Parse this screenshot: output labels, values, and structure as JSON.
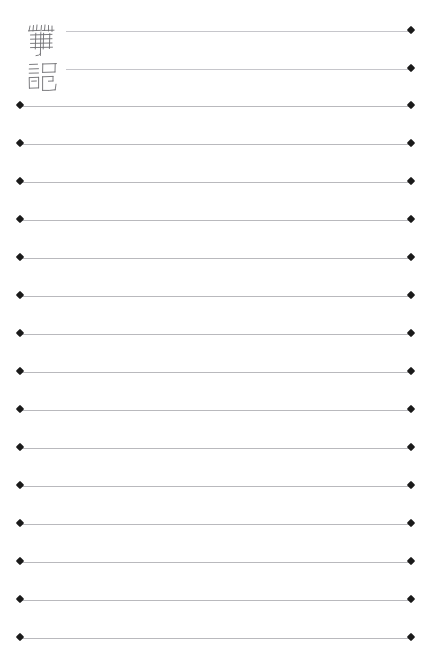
{
  "page": {
    "kind": "notebook-ruled-page",
    "width": 430,
    "height": 670,
    "background_color": "#ffffff",
    "title_text": "筆記",
    "title_reading": "bi ji",
    "title_meaning": "notes",
    "title_style": "handwritten",
    "title_ink_color": "#6e6e72"
  },
  "ruling": {
    "line_color": "#b9b9bd",
    "endpoint_color": "#1a1a1a",
    "endpoint_shape": "diamond",
    "line_count": 17,
    "left_margin_x": 20,
    "right_margin_x": 411,
    "indented_left_x": 66,
    "lines": [
      {
        "index": 1,
        "y": 31,
        "left_x": 66,
        "right_x": 411,
        "indented": true,
        "left_cap": false,
        "right_cap": true
      },
      {
        "index": 2,
        "y": 69,
        "left_x": 66,
        "right_x": 411,
        "indented": true,
        "left_cap": false,
        "right_cap": true
      },
      {
        "index": 3,
        "y": 106,
        "left_x": 20,
        "right_x": 411,
        "indented": false,
        "left_cap": true,
        "right_cap": true
      },
      {
        "index": 4,
        "y": 144,
        "left_x": 20,
        "right_x": 411,
        "indented": false,
        "left_cap": true,
        "right_cap": true
      },
      {
        "index": 5,
        "y": 182,
        "left_x": 20,
        "right_x": 411,
        "indented": false,
        "left_cap": true,
        "right_cap": true
      },
      {
        "index": 6,
        "y": 220,
        "left_x": 20,
        "right_x": 411,
        "indented": false,
        "left_cap": true,
        "right_cap": true
      },
      {
        "index": 7,
        "y": 258,
        "left_x": 20,
        "right_x": 411,
        "indented": false,
        "left_cap": true,
        "right_cap": true
      },
      {
        "index": 8,
        "y": 296,
        "left_x": 20,
        "right_x": 411,
        "indented": false,
        "left_cap": true,
        "right_cap": true
      },
      {
        "index": 9,
        "y": 334,
        "left_x": 20,
        "right_x": 411,
        "indented": false,
        "left_cap": true,
        "right_cap": true
      },
      {
        "index": 10,
        "y": 372,
        "left_x": 20,
        "right_x": 411,
        "indented": false,
        "left_cap": true,
        "right_cap": true
      },
      {
        "index": 11,
        "y": 410,
        "left_x": 20,
        "right_x": 411,
        "indented": false,
        "left_cap": true,
        "right_cap": true
      },
      {
        "index": 12,
        "y": 448,
        "left_x": 20,
        "right_x": 411,
        "indented": false,
        "left_cap": true,
        "right_cap": true
      },
      {
        "index": 13,
        "y": 486,
        "left_x": 20,
        "right_x": 411,
        "indented": false,
        "left_cap": true,
        "right_cap": true
      },
      {
        "index": 14,
        "y": 524,
        "left_x": 20,
        "right_x": 411,
        "indented": false,
        "left_cap": true,
        "right_cap": true
      },
      {
        "index": 15,
        "y": 562,
        "left_x": 20,
        "right_x": 411,
        "indented": false,
        "left_cap": true,
        "right_cap": true
      },
      {
        "index": 16,
        "y": 600,
        "left_x": 20,
        "right_x": 411,
        "indented": false,
        "left_cap": true,
        "right_cap": true
      },
      {
        "index": 17,
        "y": 638,
        "left_x": 20,
        "right_x": 411,
        "indented": false,
        "left_cap": true,
        "right_cap": true
      }
    ]
  }
}
